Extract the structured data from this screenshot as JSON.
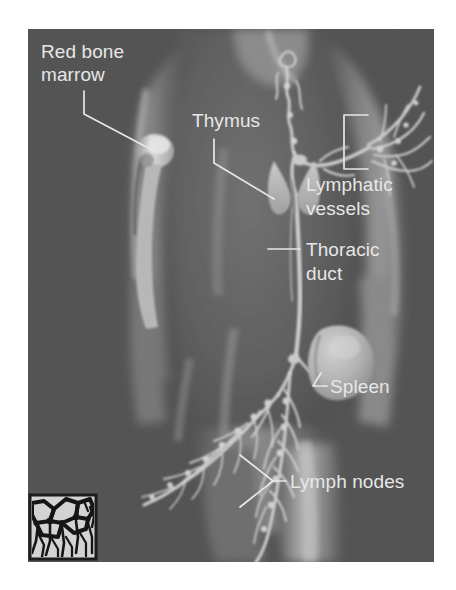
{
  "figure": {
    "background_color": "#ffffff",
    "plate_color": "#4e4e4e",
    "label_color": "#f2f2f2",
    "vessel_color": "#d8d8d8",
    "body_highlight_color": "#b4b4b4"
  },
  "labels": {
    "red_bone_marrow": "Red bone\nmarrow",
    "red_bone_marrow_line1": "Red bone",
    "red_bone_marrow_line2": "marrow",
    "thymus": "Thymus",
    "lymphatic_vessels_line1": "Lymphatic",
    "lymphatic_vessels_line2": "vessels",
    "thoracic_duct_line1": "Thoracic",
    "thoracic_duct_line2": "duct",
    "spleen": "Spleen",
    "lymph_nodes": "Lymph nodes"
  },
  "structures": [
    {
      "id": "red-bone-marrow",
      "label": "Red bone marrow",
      "leader": "angled"
    },
    {
      "id": "thymus",
      "label": "Thymus",
      "leader": "angled"
    },
    {
      "id": "lymphatic-vessels",
      "label": "Lymphatic vessels",
      "leader": "bracket"
    },
    {
      "id": "thoracic-duct",
      "label": "Thoracic duct",
      "leader": "straight"
    },
    {
      "id": "spleen",
      "label": "Spleen",
      "leader": "angled"
    },
    {
      "id": "lymph-nodes",
      "label": "Lymph nodes",
      "leader": "bracket"
    }
  ],
  "inset": {
    "name": "lymphatic-capillary-network-inset",
    "caption": "",
    "border_color": "#111111",
    "background_color": "#d8d8d8",
    "network_color": "#000000"
  }
}
